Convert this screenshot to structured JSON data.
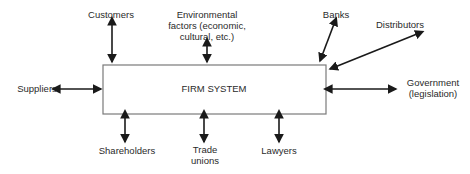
{
  "diagram": {
    "center": {
      "label": "FIRM SYSTEM"
    },
    "nodes": {
      "customers": {
        "lines": [
          "Customers"
        ]
      },
      "environmental": {
        "lines": [
          "Environmental",
          "factors (economic,",
          "cultural, etc.)"
        ]
      },
      "banks": {
        "lines": [
          "Banks"
        ]
      },
      "distributors": {
        "lines": [
          "Distributors"
        ]
      },
      "suppliers": {
        "lines": [
          "Suppliers"
        ]
      },
      "government": {
        "lines": [
          "Government",
          "(legislation)"
        ]
      },
      "shareholders": {
        "lines": [
          "Shareholders"
        ]
      },
      "trade_unions": {
        "lines": [
          "Trade",
          "unions"
        ]
      },
      "lawyers": {
        "lines": [
          "Lawyers"
        ]
      }
    },
    "edges": [
      {
        "from": "firm",
        "to": "customers",
        "type": "bidirectional"
      },
      {
        "from": "firm",
        "to": "environmental",
        "type": "bidirectional"
      },
      {
        "from": "firm",
        "to": "banks",
        "type": "bidirectional"
      },
      {
        "from": "firm",
        "to": "distributors",
        "type": "bidirectional"
      },
      {
        "from": "firm",
        "to": "suppliers",
        "type": "bidirectional"
      },
      {
        "from": "firm",
        "to": "government",
        "type": "bidirectional"
      },
      {
        "from": "firm",
        "to": "shareholders",
        "type": "bidirectional"
      },
      {
        "from": "firm",
        "to": "trade_unions",
        "type": "bidirectional"
      },
      {
        "from": "firm",
        "to": "lawyers",
        "type": "bidirectional"
      }
    ]
  }
}
